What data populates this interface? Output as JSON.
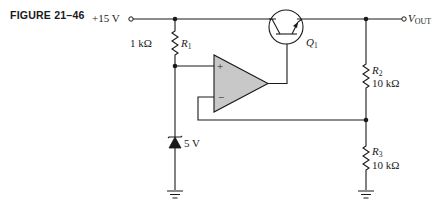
{
  "figure": {
    "label": "FIGURE 21–46"
  },
  "supply": {
    "label": "+15 V"
  },
  "output": {
    "label_main": "V",
    "label_sub": "OUT"
  },
  "components": {
    "r1": {
      "name": "R",
      "sub": "1",
      "value": "1 kΩ"
    },
    "r2": {
      "name": "R",
      "sub": "2",
      "value": "10 kΩ"
    },
    "r3": {
      "name": "R",
      "sub": "3",
      "value": "10 kΩ"
    },
    "q1": {
      "name": "Q",
      "sub": "1"
    },
    "zener": {
      "value": "5 V"
    },
    "opamp": {
      "plus": "+",
      "minus": "−",
      "fill": "#c8c8c8"
    }
  }
}
